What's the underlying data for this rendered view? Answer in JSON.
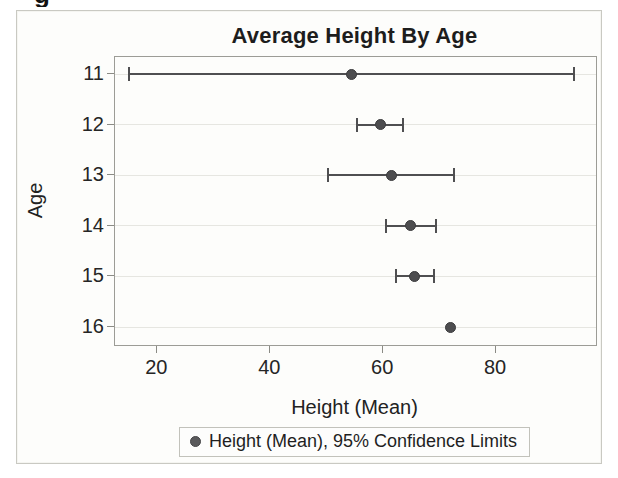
{
  "figure": {
    "cropped_text_fragment": "g",
    "title": "Average Height By Age",
    "x_axis": {
      "label": "Height (Mean)",
      "ticks": [
        "20",
        "40",
        "60",
        "80"
      ]
    },
    "y_axis": {
      "label": "Age",
      "ticks": [
        "11",
        "12",
        "13",
        "14",
        "15",
        "16"
      ]
    },
    "legend": {
      "label": "Height (Mean), 95% Confidence Limits"
    }
  },
  "chart_data": {
    "type": "scatter",
    "subtype": "horizontal-dot-with-error-bars",
    "title": "Average Height By Age",
    "xlabel": "Height (Mean)",
    "ylabel": "Age",
    "xlim": [
      12.5,
      97.7
    ],
    "x_ticks": [
      20,
      40,
      60,
      80
    ],
    "categories": [
      11,
      12,
      13,
      14,
      15,
      16
    ],
    "series": [
      {
        "name": "Height (Mean), 95% Confidence Limits",
        "points": [
          {
            "age": 11,
            "mean": 54.4,
            "lower": 15.0,
            "upper": 93.8
          },
          {
            "age": 12,
            "mean": 59.44,
            "lower": 55.35,
            "upper": 63.53
          },
          {
            "age": 13,
            "mean": 61.43,
            "lower": 50.26,
            "upper": 72.6
          },
          {
            "age": 14,
            "mean": 64.9,
            "lower": 60.44,
            "upper": 69.36
          },
          {
            "age": 15,
            "mean": 65.63,
            "lower": 62.29,
            "upper": 68.96
          },
          {
            "age": 16,
            "mean": 72.0,
            "lower": null,
            "upper": null
          }
        ]
      }
    ],
    "legend": [
      "Height (Mean), 95% Confidence Limits"
    ],
    "legend_position": "bottom",
    "grid": "horizontal"
  },
  "colors": {
    "marker": "#4d4d4f",
    "error_bar": "#4f4f51",
    "gridline": "#e6e6e1",
    "wall_border": "#9c9c96",
    "frame_border": "#c9c9c2",
    "text": "#222222",
    "background": "#fdfdfb"
  }
}
